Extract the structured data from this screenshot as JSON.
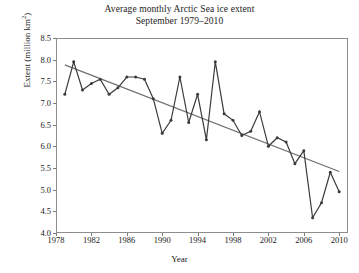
{
  "chart_data": {
    "type": "line",
    "title": "Average monthly Arctic Sea ice extent",
    "subtitle": "September 1979–2010",
    "xlabel": "Year",
    "ylabel": "Extent (million km²)",
    "ylabel_base": "Extent (million km",
    "ylabel_sup": "2",
    "ylabel_close": ")",
    "xlim": [
      1978,
      2011
    ],
    "ylim": [
      4.0,
      8.5
    ],
    "yticks": [
      "8.5",
      "8.0",
      "7.5",
      "7.0",
      "6.5",
      "6.0",
      "5.5",
      "5.0",
      "4.5",
      "4.0"
    ],
    "ytick_values": [
      8.5,
      8.0,
      7.5,
      7.0,
      6.5,
      6.0,
      5.5,
      5.0,
      4.5,
      4.0
    ],
    "xticks": [
      "1978",
      "1982",
      "1986",
      "1990",
      "1994",
      "1998",
      "2002",
      "2006",
      "2010"
    ],
    "xtick_values": [
      1978,
      1982,
      1986,
      1990,
      1994,
      1998,
      2002,
      2006,
      2010
    ],
    "grid": false,
    "legend": "none",
    "markers": "dot",
    "series": [
      {
        "name": "September sea ice extent",
        "color": "#3b3b3b",
        "x": [
          1979,
          1980,
          1981,
          1982,
          1983,
          1984,
          1985,
          1986,
          1987,
          1988,
          1989,
          1990,
          1991,
          1992,
          1993,
          1994,
          1995,
          1996,
          1997,
          1998,
          1999,
          2000,
          2001,
          2002,
          2003,
          2004,
          2005,
          2006,
          2007,
          2008,
          2009,
          2010
        ],
        "values": [
          7.2,
          7.95,
          7.3,
          7.45,
          7.55,
          7.2,
          7.35,
          7.6,
          7.6,
          7.55,
          7.1,
          6.3,
          6.6,
          7.6,
          6.55,
          7.2,
          6.15,
          7.95,
          6.75,
          6.6,
          6.25,
          6.35,
          6.8,
          6.0,
          6.2,
          6.1,
          5.6,
          5.9,
          4.35,
          4.7,
          5.4,
          4.95
        ]
      },
      {
        "name": "Linear trend",
        "color": "#6f6f6f",
        "x": [
          1979,
          2010
        ],
        "values": [
          7.88,
          5.42
        ]
      }
    ]
  }
}
